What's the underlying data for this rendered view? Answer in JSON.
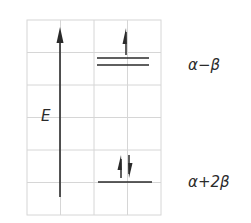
{
  "diagram": {
    "type": "molecular-orbital-energy-level-diagram",
    "axis": {
      "label": "E",
      "direction": "up"
    },
    "grid": {
      "columns": 4,
      "rows": 6,
      "line_color": "#d6d6d6"
    },
    "levels": [
      {
        "id": "upper",
        "label": "α−β",
        "degenerate": true,
        "line_count": 2,
        "electrons": [
          {
            "spin": "up"
          }
        ]
      },
      {
        "id": "lower",
        "label": "α+2β",
        "degenerate": false,
        "line_count": 1,
        "electrons": [
          {
            "spin": "up"
          },
          {
            "spin": "down"
          }
        ]
      }
    ],
    "colors": {
      "ink": "#2a2a2a",
      "grid": "#d6d6d6",
      "background": "#ffffff"
    }
  }
}
